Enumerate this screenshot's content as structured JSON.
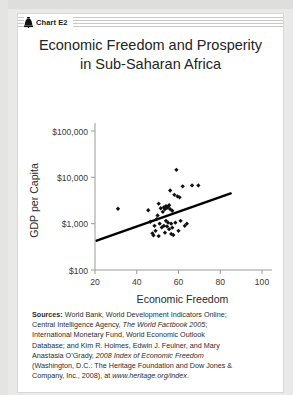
{
  "page": {
    "background_color": "#e9e9e7",
    "card_background": "#ffffff"
  },
  "header": {
    "icon": "liberty-bell-icon",
    "label": "Chart E2"
  },
  "title": {
    "line1": "Economic Freedom and Prosperity",
    "line2": "in Sub-Saharan Africa"
  },
  "chart_data": {
    "type": "scatter",
    "title": "Economic Freedom and Prosperity in Sub-Saharan Africa",
    "xlabel": "Economic Freedom",
    "ylabel": "GDP per Capita",
    "xlim": [
      20,
      100
    ],
    "ylim": [
      100,
      100000
    ],
    "yscale": "log",
    "xticks": [
      20,
      40,
      60,
      80,
      100
    ],
    "xtick_labels": [
      "20",
      "40",
      "60",
      "80",
      "100"
    ],
    "yticks": [
      100,
      1000,
      10000,
      100000
    ],
    "ytick_labels": [
      "$100",
      "$1,000",
      "$10,000",
      "$100,000"
    ],
    "grid": false,
    "legend": false,
    "marker": "diamond",
    "marker_color": "#111111",
    "points": [
      {
        "x": 31.0,
        "y": 2100
      },
      {
        "x": 45.5,
        "y": 1950
      },
      {
        "x": 46.5,
        "y": 1100
      },
      {
        "x": 47.5,
        "y": 620
      },
      {
        "x": 48.0,
        "y": 560
      },
      {
        "x": 48.5,
        "y": 900
      },
      {
        "x": 49.0,
        "y": 700
      },
      {
        "x": 49.5,
        "y": 1250
      },
      {
        "x": 50.0,
        "y": 1500
      },
      {
        "x": 50.5,
        "y": 2700
      },
      {
        "x": 50.5,
        "y": 540
      },
      {
        "x": 51.0,
        "y": 1000
      },
      {
        "x": 51.5,
        "y": 2150
      },
      {
        "x": 52.0,
        "y": 830
      },
      {
        "x": 52.5,
        "y": 1800
      },
      {
        "x": 53.0,
        "y": 2250
      },
      {
        "x": 53.0,
        "y": 900
      },
      {
        "x": 53.5,
        "y": 2050
      },
      {
        "x": 53.5,
        "y": 640
      },
      {
        "x": 54.0,
        "y": 2400
      },
      {
        "x": 54.0,
        "y": 1150
      },
      {
        "x": 54.5,
        "y": 2200
      },
      {
        "x": 54.5,
        "y": 870
      },
      {
        "x": 55.0,
        "y": 2300
      },
      {
        "x": 55.0,
        "y": 1050
      },
      {
        "x": 55.5,
        "y": 2500
      },
      {
        "x": 55.5,
        "y": 760
      },
      {
        "x": 56.0,
        "y": 5200
      },
      {
        "x": 56.0,
        "y": 2050
      },
      {
        "x": 56.5,
        "y": 1000
      },
      {
        "x": 56.5,
        "y": 600
      },
      {
        "x": 57.0,
        "y": 1900
      },
      {
        "x": 57.0,
        "y": 820
      },
      {
        "x": 57.5,
        "y": 570
      },
      {
        "x": 58.0,
        "y": 4200
      },
      {
        "x": 58.5,
        "y": 1050
      },
      {
        "x": 59.0,
        "y": 14500
      },
      {
        "x": 59.5,
        "y": 3900
      },
      {
        "x": 60.0,
        "y": 700
      },
      {
        "x": 60.5,
        "y": 3700
      },
      {
        "x": 61.0,
        "y": 1150
      },
      {
        "x": 62.0,
        "y": 6400
      },
      {
        "x": 63.0,
        "y": 900
      },
      {
        "x": 64.0,
        "y": 1000
      },
      {
        "x": 66.5,
        "y": 6700
      },
      {
        "x": 69.5,
        "y": 6700
      }
    ],
    "trendline": {
      "x_start": 20.8,
      "y_start": 430,
      "x_end": 85.0,
      "y_end": 4500,
      "color": "#000000"
    }
  },
  "sources": {
    "label": "Sources:",
    "lines": [
      {
        "prefix": "Sources:",
        "text": " World Bank, World Development Indicators Online;"
      },
      {
        "text": "Central Intelligence Agency, ",
        "italic": "The World Factbook 2005",
        "suffix": ";"
      },
      {
        "text": "International Monetary Fund, World Economic Outlook"
      },
      {
        "text": "Database; and Kim R. Holmes, Edwin J. Feulner, and Mary"
      },
      {
        "text": "Anastasia O’Grady, ",
        "italic": "2008 Index of Economic Freedom"
      },
      {
        "text": "(Washington, D.C.: The Heritage Foundation and Dow Jones &"
      },
      {
        "text": "Company, Inc., 2008), at ",
        "italic": "www.heritage.org/index",
        "suffix": "."
      }
    ]
  }
}
